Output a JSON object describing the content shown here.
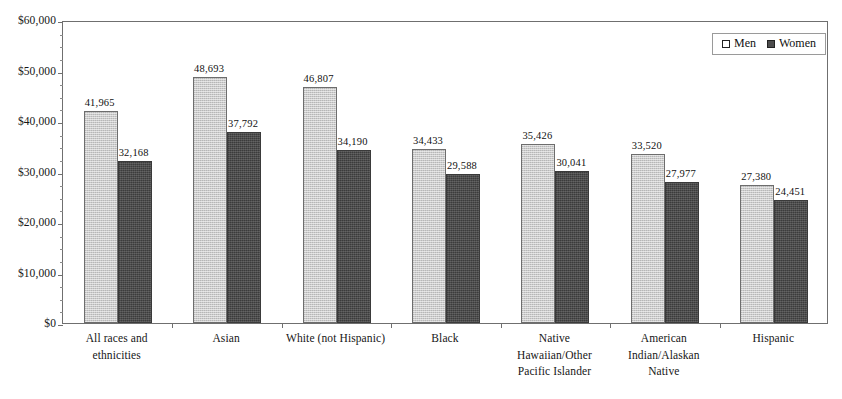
{
  "chart_data": {
    "type": "bar",
    "title": "",
    "subtitle": "",
    "xlabel": "",
    "ylabel": "",
    "ylim": [
      0,
      60000
    ],
    "grid": false,
    "legend_position": "top-right",
    "y_tick_labels": [
      "$60,000",
      "$50,000",
      "$40,000",
      "$30,000",
      "$20,000",
      "$10,000",
      "$0"
    ],
    "y_tick_values": [
      60000,
      50000,
      40000,
      30000,
      20000,
      10000,
      0
    ],
    "categories": [
      "All races and\nethnicities",
      "Asian",
      "White (not Hispanic)",
      "Black",
      "Native\nHawaiian/Other\nPacific Islander",
      "American\nIndian/Alaskan\nNative",
      "Hispanic"
    ],
    "category_lines": [
      [
        "All races and",
        "ethnicities"
      ],
      [
        "Asian"
      ],
      [
        "White (not Hispanic)"
      ],
      [
        "Black"
      ],
      [
        "Native",
        "Hawaiian/Other",
        "Pacific Islander"
      ],
      [
        "American",
        "Indian/Alaskan",
        "Native"
      ],
      [
        "Hispanic"
      ]
    ],
    "series": [
      {
        "name": "Men",
        "color": "#cbcbcb",
        "values": [
          41965,
          48693,
          46807,
          34433,
          35426,
          33520,
          27380
        ],
        "labels": [
          "41,965",
          "48,693",
          "46,807",
          "34,433",
          "35,426",
          "33,520",
          "27,380"
        ]
      },
      {
        "name": "Women",
        "color": "#4c4c4c",
        "values": [
          32168,
          37792,
          34190,
          29588,
          30041,
          27977,
          24451
        ],
        "labels": [
          "32,168",
          "37,792",
          "34,190",
          "29,588",
          "30,041",
          "27,977",
          "24,451"
        ]
      }
    ]
  },
  "legend": {
    "items": [
      {
        "label": "Men",
        "swatch": "open-square-swatch"
      },
      {
        "label": "Women",
        "swatch": "filled-square-swatch"
      }
    ]
  },
  "colors": {
    "men_bar": "#cbcbcb",
    "women_bar": "#4c4c4c",
    "axis": "#6f6f6f",
    "text": "#161616",
    "background": "#ffffff"
  }
}
